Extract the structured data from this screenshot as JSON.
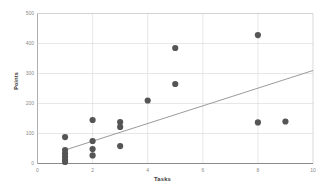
{
  "chart_data": {
    "type": "scatter",
    "title": "",
    "xlabel": "Tasks",
    "ylabel": "Points",
    "xlim": [
      0,
      10
    ],
    "ylim": [
      0,
      500
    ],
    "xticks": [
      "0",
      "2",
      "4",
      "6",
      "8",
      "10"
    ],
    "xtick_values": [
      0,
      2,
      4,
      6,
      8,
      10
    ],
    "yticks": [
      "0",
      "100",
      "200",
      "300",
      "400",
      "500"
    ],
    "ytick_values": [
      0,
      100,
      200,
      300,
      400,
      500
    ],
    "grid": "both",
    "legend": "none",
    "marker": {
      "shape": "circle",
      "color": "#555555",
      "size": 3.1
    },
    "points": [
      {
        "x": 1,
        "y": 88
      },
      {
        "x": 1,
        "y": 45
      },
      {
        "x": 1,
        "y": 33
      },
      {
        "x": 1,
        "y": 22
      },
      {
        "x": 1,
        "y": 12
      },
      {
        "x": 1,
        "y": 5
      },
      {
        "x": 2,
        "y": 145
      },
      {
        "x": 2,
        "y": 75
      },
      {
        "x": 2,
        "y": 48
      },
      {
        "x": 2,
        "y": 27
      },
      {
        "x": 3,
        "y": 138
      },
      {
        "x": 3,
        "y": 122
      },
      {
        "x": 3,
        "y": 58
      },
      {
        "x": 4,
        "y": 210
      },
      {
        "x": 5,
        "y": 385
      },
      {
        "x": 5,
        "y": 265
      },
      {
        "x": 8,
        "y": 428
      },
      {
        "x": 8,
        "y": 137
      },
      {
        "x": 9,
        "y": 140
      }
    ],
    "trendline": {
      "type": "linear",
      "color": "#8f8f8f",
      "x_start": 1.0,
      "y_start": 45,
      "x_end": 10.0,
      "y_end": 310
    }
  }
}
